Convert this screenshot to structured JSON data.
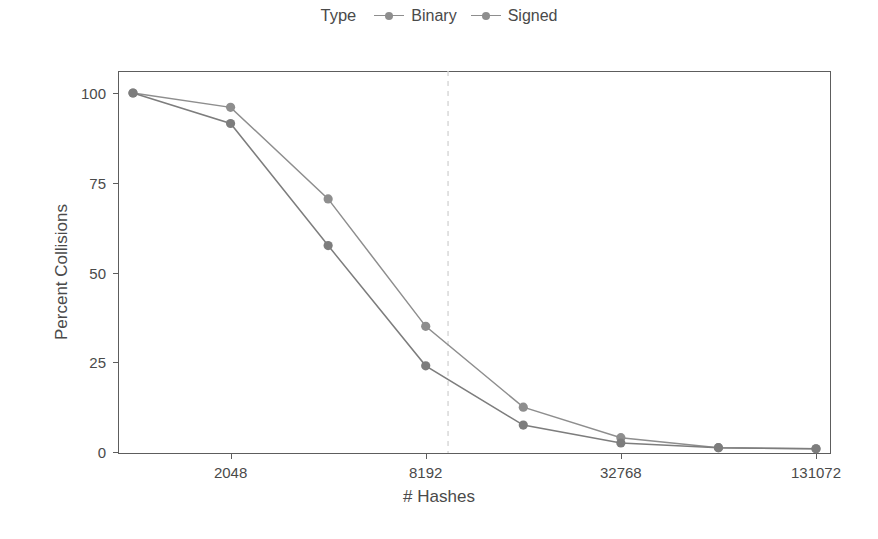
{
  "chart_data": {
    "type": "line",
    "title": "",
    "xlabel": "# Hashes",
    "ylabel": "Percent Collisions",
    "legend_title": "Type",
    "legend_position": "top-center",
    "grid": false,
    "xscale": "log2",
    "x": [
      1024,
      2048,
      4096,
      8192,
      16384,
      32768,
      65536,
      131072
    ],
    "xtick_labels": [
      "2048",
      "8192",
      "32768",
      "131072"
    ],
    "xtick_values": [
      2048,
      8192,
      32768,
      131072
    ],
    "ytick_labels": [
      "0",
      "25",
      "50",
      "75",
      "100"
    ],
    "ytick_values": [
      0,
      25,
      50,
      75,
      100
    ],
    "ylim": [
      0,
      100
    ],
    "series": [
      {
        "name": "Binary",
        "color": "#8e8e8e",
        "x": [
          1024,
          2048,
          4096,
          8192,
          16384,
          32768,
          65536,
          131072
        ],
        "values": [
          100,
          96,
          70.5,
          35,
          12.5,
          4,
          1.2,
          0.9
        ]
      },
      {
        "name": "Signed",
        "color": "#7d7d7d",
        "x": [
          1024,
          2048,
          4096,
          8192,
          16384,
          32768,
          65536,
          131072
        ],
        "values": [
          100,
          91.5,
          57.5,
          24,
          7.5,
          2.5,
          1.2,
          0.9
        ]
      }
    ],
    "annotations": [
      {
        "type": "vline",
        "x": 9600,
        "style": "dashed",
        "color": "#d6d6d6"
      }
    ]
  }
}
